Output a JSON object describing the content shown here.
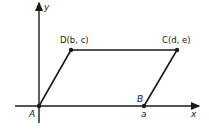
{
  "figure": {
    "axes": {
      "x_label": "x",
      "y_label": "y"
    },
    "points": {
      "A": {
        "label": "A",
        "coord_text": ""
      },
      "B": {
        "label": "B",
        "coord_text": "a"
      },
      "C": {
        "label": "C(d, e)"
      },
      "D": {
        "label": "D(b, c)"
      }
    },
    "stroke_color": "#1a1a1a",
    "background_color": "#ffffff"
  }
}
